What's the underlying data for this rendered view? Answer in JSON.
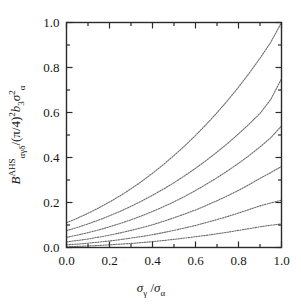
{
  "figure": {
    "background_color": "#ffffff",
    "frame_color": "#2b2b2b",
    "curve_color": "#6e6e6e"
  },
  "axis": {
    "x_tick_labels": [
      "0.0",
      "0.2",
      "0.4",
      "0.6",
      "0.8",
      "1.0"
    ],
    "y_tick_labels": [
      "0.0",
      "0.2",
      "0.4",
      "0.6",
      "0.8",
      "1.0"
    ],
    "x_title_parts": {
      "sigma1": "σ",
      "sub1": "γ",
      "slash": " /",
      "sigma2": "σ",
      "sub2": "α"
    },
    "y_title_parts": {
      "b_symbol": "B",
      "b_sup": "AHS",
      "b_sub": "αγδ",
      "divider": "/(π/4)",
      "paren_sup": "2",
      "b3_symbol": "b",
      "b3_sub": "3",
      "sigma": "σ",
      "sigma_sup": "2",
      "sigma_sub": "α"
    }
  },
  "chart_data": {
    "type": "line",
    "title": "",
    "xlabel": "σ_γ / σ_α",
    "ylabel": "B^AHS_αγδ / (π/4)² b₃ σ²_α",
    "xlim": [
      0.0,
      1.0
    ],
    "ylim": [
      0.0,
      1.0
    ],
    "grid": false,
    "legend": "none",
    "linestyle": "dotted",
    "x": [
      0.0,
      0.05,
      0.1,
      0.15,
      0.2,
      0.25,
      0.3,
      0.35,
      0.4,
      0.45,
      0.5,
      0.55,
      0.6,
      0.65,
      0.7,
      0.75,
      0.8,
      0.85,
      0.9,
      0.95,
      1.0
    ],
    "series": [
      {
        "name": "curve-1",
        "values": [
          0.11,
          0.13,
          0.152,
          0.176,
          0.202,
          0.23,
          0.261,
          0.294,
          0.33,
          0.368,
          0.409,
          0.452,
          0.498,
          0.547,
          0.599,
          0.654,
          0.713,
          0.775,
          0.841,
          0.912,
          1.0
        ]
      },
      {
        "name": "curve-2",
        "values": [
          0.075,
          0.089,
          0.105,
          0.122,
          0.141,
          0.161,
          0.183,
          0.207,
          0.232,
          0.259,
          0.288,
          0.319,
          0.352,
          0.387,
          0.424,
          0.463,
          0.505,
          0.549,
          0.596,
          0.658,
          0.75
        ]
      },
      {
        "name": "curve-3",
        "values": [
          0.045,
          0.055,
          0.066,
          0.078,
          0.092,
          0.107,
          0.123,
          0.141,
          0.16,
          0.181,
          0.203,
          0.227,
          0.253,
          0.281,
          0.31,
          0.341,
          0.374,
          0.409,
          0.447,
          0.488,
          0.54
        ]
      },
      {
        "name": "curve-4",
        "values": [
          0.025,
          0.031,
          0.038,
          0.046,
          0.055,
          0.065,
          0.076,
          0.088,
          0.101,
          0.116,
          0.132,
          0.149,
          0.167,
          0.187,
          0.208,
          0.23,
          0.254,
          0.28,
          0.307,
          0.333,
          0.36
        ]
      },
      {
        "name": "curve-5",
        "values": [
          0.012,
          0.015,
          0.019,
          0.024,
          0.029,
          0.035,
          0.042,
          0.049,
          0.057,
          0.066,
          0.076,
          0.087,
          0.098,
          0.111,
          0.124,
          0.138,
          0.153,
          0.169,
          0.185,
          0.198,
          0.21
        ]
      },
      {
        "name": "curve-6",
        "values": [
          0.003,
          0.005,
          0.007,
          0.009,
          0.012,
          0.015,
          0.018,
          0.022,
          0.026,
          0.031,
          0.036,
          0.042,
          0.048,
          0.054,
          0.061,
          0.068,
          0.076,
          0.084,
          0.092,
          0.099,
          0.105
        ]
      }
    ]
  }
}
